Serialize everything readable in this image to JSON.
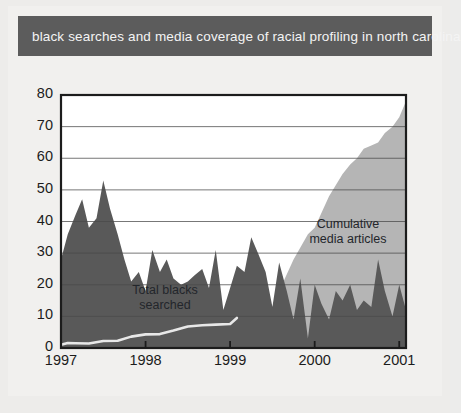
{
  "banner": {
    "title": "black searches and media coverage of racial profiling in north carolina"
  },
  "colors": {
    "banner_bg": "#5c5c5c",
    "banner_text": "#f4f4f4",
    "page_bg": "#edecea",
    "panel_bg": "#f1f0ee",
    "dark_series": "#595959",
    "light_series": "#b5b5b5",
    "line_series": "#e8e8e8",
    "axis": "#1c1c1c",
    "gridline": "#4a4a4a"
  },
  "annotations": {
    "searched": "Total blacks\nsearched",
    "searched_line1": "Total blacks",
    "searched_line2": "searched",
    "media": "Cumulative\nmedia articles",
    "media_line1": "Cumulative",
    "media_line2": "media articles"
  },
  "chart_data": {
    "type": "area",
    "title": "black searches and media coverage of racial profiling in north carolina",
    "xlabel": "",
    "ylabel": "",
    "xlim": [
      1997.0,
      2001.08
    ],
    "ylim": [
      0,
      80
    ],
    "grid": true,
    "legend": "inline-annotations",
    "xticks": [
      1997,
      1998,
      1999,
      2000,
      2001
    ],
    "xticklabels": [
      "1997",
      "1998",
      "1999",
      "2000",
      "2001"
    ],
    "yticks": [
      0,
      10,
      20,
      30,
      40,
      50,
      60,
      70,
      80
    ],
    "yticklabels": [
      "0",
      "10",
      "20",
      "30",
      "40",
      "50",
      "60",
      "70",
      "80"
    ],
    "series": [
      {
        "name": "Total blacks searched",
        "kind": "area",
        "color": "#595959",
        "x": [
          1997.0,
          1997.08,
          1997.17,
          1997.25,
          1997.33,
          1997.42,
          1997.5,
          1997.58,
          1997.67,
          1997.75,
          1997.83,
          1997.92,
          1998.0,
          1998.08,
          1998.17,
          1998.25,
          1998.33,
          1998.42,
          1998.5,
          1998.58,
          1998.67,
          1998.75,
          1998.83,
          1998.92,
          1999.0,
          1999.08,
          1999.17,
          1999.25,
          1999.33,
          1999.42,
          1999.5,
          1999.58,
          1999.67,
          1999.75,
          1999.83,
          1999.92,
          2000.0,
          2000.08,
          2000.17,
          2000.25,
          2000.33,
          2000.42,
          2000.5,
          2000.58,
          2000.67,
          2000.75,
          2000.83,
          2000.92,
          2001.0,
          2001.08
        ],
        "values": [
          28,
          36,
          42,
          47,
          38,
          41,
          53,
          44,
          36,
          28,
          21,
          24,
          18,
          31,
          24,
          28,
          22,
          20,
          21,
          23,
          25,
          19,
          31,
          12,
          19,
          26,
          24,
          35,
          30,
          24,
          13,
          27,
          18,
          9,
          22,
          3,
          20,
          14,
          9,
          18,
          15,
          20,
          12,
          15,
          13,
          28,
          18,
          10,
          20,
          12
        ]
      },
      {
        "name": "Cumulative media articles",
        "kind": "area",
        "color": "#b5b5b5",
        "x": [
          1997.0,
          1998.0,
          1999.0,
          1999.25,
          1999.42,
          1999.58,
          1999.75,
          1999.92,
          2000.0,
          2000.17,
          2000.33,
          2000.42,
          2000.5,
          2000.58,
          2000.67,
          2000.75,
          2000.83,
          2000.92,
          2001.0,
          2001.08
        ],
        "values": [
          0,
          0,
          0,
          2,
          8,
          18,
          28,
          36,
          38,
          48,
          55,
          58,
          60,
          63,
          64,
          65,
          68,
          70,
          73,
          78
        ]
      },
      {
        "name": "searched rate line",
        "kind": "line",
        "color": "#e8e8e8",
        "x": [
          1997.0,
          1997.08,
          1997.17,
          1997.33,
          1997.5,
          1997.67,
          1997.83,
          1998.0,
          1998.17,
          1998.33,
          1998.5,
          1998.67,
          1998.83,
          1999.0,
          1999.08
        ],
        "values": [
          1.0,
          1.6,
          1.5,
          1.4,
          2.2,
          2.3,
          3.6,
          4.3,
          4.4,
          5.5,
          6.8,
          7.2,
          7.4,
          7.6,
          9.5
        ]
      }
    ]
  }
}
